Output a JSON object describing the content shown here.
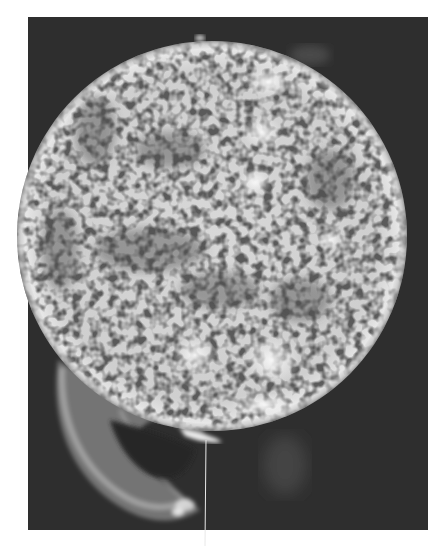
{
  "image": {
    "subject": "solar-disk-photograph",
    "description": "Grayscale photograph of the Sun's chromosphere showing mottled granulation, bright plage regions, dark filaments, and a large prominence loop at the lower-left limb",
    "colors": {
      "page_background": "#ffffff",
      "frame_background": "#2e2e2e",
      "disk_bright": "#f2f2f2",
      "disk_mid": "#8a8a8a",
      "disk_dark": "#4a4a4a",
      "prominence": "#9a9a9a",
      "crack_line": "#e8e8e8"
    },
    "frame": {
      "x": 28,
      "y": 17,
      "width": 400,
      "height": 513
    },
    "sun": {
      "cx": 212,
      "cy": 236,
      "r": 195
    },
    "plages": [
      {
        "cx": 195,
        "cy": 355,
        "rx": 20,
        "ry": 16
      },
      {
        "cx": 272,
        "cy": 360,
        "rx": 26,
        "ry": 22
      },
      {
        "cx": 268,
        "cy": 82,
        "rx": 22,
        "ry": 14
      },
      {
        "cx": 262,
        "cy": 132,
        "rx": 18,
        "ry": 14
      },
      {
        "cx": 255,
        "cy": 182,
        "rx": 14,
        "ry": 12
      },
      {
        "cx": 265,
        "cy": 405,
        "rx": 30,
        "ry": 10
      },
      {
        "cx": 330,
        "cy": 240,
        "rx": 12,
        "ry": 10
      }
    ]
  }
}
